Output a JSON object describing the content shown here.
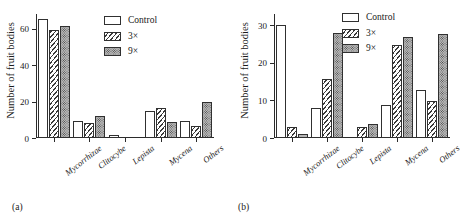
{
  "figure": {
    "panels": [
      {
        "tag": "(a)",
        "ylabel": "Number of fruit bodies",
        "yticks": [
          0,
          20,
          40,
          60
        ],
        "ymax": 68,
        "legend": [
          {
            "label": "Control",
            "pattern": "empty"
          },
          {
            "label": "3×",
            "pattern": "diagonal-hatch"
          },
          {
            "label": "9×",
            "pattern": "dotted"
          }
        ],
        "categories": [
          "Mycorrhizae",
          "Clitocybe",
          "Lepista",
          "Mycena",
          "Others"
        ],
        "series": [
          {
            "name": "Control",
            "values": [
              65,
              9.5,
              1.5,
              15,
              9.5
            ]
          },
          {
            "name": "3×",
            "values": [
              59.5,
              8,
              0,
              16.5,
              6.5
            ]
          },
          {
            "name": "9×",
            "values": [
              61.5,
              12,
              0,
              9,
              20
            ]
          }
        ]
      },
      {
        "tag": "(b)",
        "ylabel": "Number of fruit bodies",
        "yticks": [
          0,
          10,
          20,
          30
        ],
        "ymax": 33,
        "legend": [
          {
            "label": "Control",
            "pattern": "empty"
          },
          {
            "label": "3×",
            "pattern": "diagonal-hatch"
          },
          {
            "label": "9×",
            "pattern": "dotted"
          }
        ],
        "categories": [
          "Mycorrhizae",
          "Clitocybe",
          "Lepista",
          "Mycena",
          "Others"
        ],
        "series": [
          {
            "name": "Control",
            "values": [
              30,
              8,
              0,
              8.8,
              12.8
            ]
          },
          {
            "name": "3×",
            "values": [
              3,
              15.8,
              2.8,
              24.8,
              9.8
            ]
          },
          {
            "name": "9×",
            "values": [
              1,
              28,
              3.8,
              26.8,
              27.8
            ]
          }
        ]
      }
    ]
  },
  "chart_data": [
    {
      "type": "bar",
      "title": "(a)",
      "categories": [
        "Mycorrhizae",
        "Clitocybe",
        "Lepista",
        "Mycena",
        "Others"
      ],
      "series": [
        {
          "name": "Control",
          "values": [
            65,
            9.5,
            1.5,
            15,
            9.5
          ]
        },
        {
          "name": "3×",
          "values": [
            59.5,
            8,
            0,
            16.5,
            6.5
          ]
        },
        {
          "name": "9×",
          "values": [
            61.5,
            12,
            0,
            9,
            20
          ]
        }
      ],
      "xlabel": "",
      "ylabel": "Number of fruit bodies",
      "ylim": [
        0,
        68
      ],
      "yticks": [
        0,
        20,
        40,
        60
      ],
      "grid": false,
      "legend_position": "upper-center"
    },
    {
      "type": "bar",
      "title": "(b)",
      "categories": [
        "Mycorrhizae",
        "Clitocybe",
        "Lepista",
        "Mycena",
        "Others"
      ],
      "series": [
        {
          "name": "Control",
          "values": [
            30,
            8,
            0,
            8.8,
            12.8
          ]
        },
        {
          "name": "3×",
          "values": [
            3,
            15.8,
            2.8,
            24.8,
            9.8
          ]
        },
        {
          "name": "9×",
          "values": [
            1,
            28,
            3.8,
            26.8,
            27.8
          ]
        }
      ],
      "xlabel": "",
      "ylabel": "Number of fruit bodies",
      "ylim": [
        0,
        33
      ],
      "yticks": [
        0,
        10,
        20,
        30
      ],
      "grid": false,
      "legend_position": "upper-center"
    }
  ]
}
